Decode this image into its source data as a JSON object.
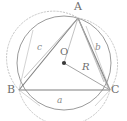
{
  "figure": {
    "background_color": "#ffffff",
    "stroke_color": "#8c8c8c",
    "triangle_color": "#7a7a7a",
    "arc_color": "#b9b9b9",
    "radius_color": "#9a9a9a",
    "label_color": "#6e6e6e"
  },
  "vertices": {
    "a_label": "A",
    "b_label": "B",
    "c_label": "C"
  },
  "center": {
    "label": "O",
    "dot_name": "circumcenter-dot"
  },
  "sides": {
    "a_label": "a",
    "b_label": "b",
    "c_label": "c"
  },
  "radius": {
    "label": "R"
  },
  "geometry": {
    "circle": {
      "cx": 64,
      "cy": 63,
      "r": 47
    },
    "points": {
      "A": {
        "x": 78,
        "y": 18
      },
      "B": {
        "x": 19,
        "y": 90
      },
      "C": {
        "x": 110,
        "y": 90
      },
      "O": {
        "x": 64,
        "y": 63
      }
    }
  }
}
